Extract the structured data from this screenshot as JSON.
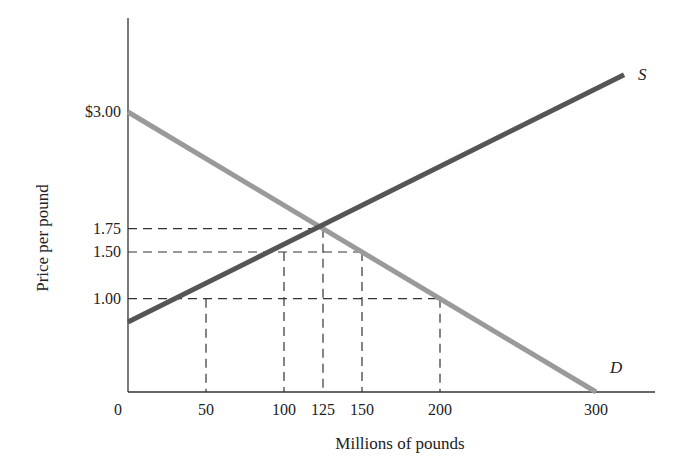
{
  "chart_data": {
    "type": "line",
    "title": "",
    "xlabel": "Millions of pounds",
    "ylabel": "Price per pound",
    "xlim": [
      0,
      340
    ],
    "ylim": [
      0,
      3.8
    ],
    "grid": false,
    "x_ticks": [
      {
        "value": 0,
        "label": "0"
      },
      {
        "value": 50,
        "label": "50"
      },
      {
        "value": 100,
        "label": "100"
      },
      {
        "value": 125,
        "label": "125"
      },
      {
        "value": 150,
        "label": "150"
      },
      {
        "value": 200,
        "label": "200"
      },
      {
        "value": 300,
        "label": "300"
      }
    ],
    "y_ticks": [
      {
        "value": 3.0,
        "label": "$3.00"
      },
      {
        "value": 1.75,
        "label": "1.75"
      },
      {
        "value": 1.5,
        "label": "1.50"
      },
      {
        "value": 1.0,
        "label": "1.00"
      }
    ],
    "series": [
      {
        "name": "S",
        "label": "S",
        "color": "#555555",
        "x": [
          0,
          318
        ],
        "y": [
          0.75,
          3.4
        ]
      },
      {
        "name": "D",
        "label": "D",
        "color": "#9a9a9a",
        "x": [
          0,
          300
        ],
        "y": [
          3.0,
          0.0
        ]
      }
    ],
    "reference_lines": [
      {
        "price": 1.75,
        "quantity": 125
      },
      {
        "price": 1.5,
        "quantity_from": 100,
        "quantity_to": 150
      },
      {
        "price": 1.0,
        "quantity_from": 50,
        "quantity_to": 200
      }
    ],
    "equilibrium": {
      "quantity": 125,
      "price": 1.75
    }
  }
}
